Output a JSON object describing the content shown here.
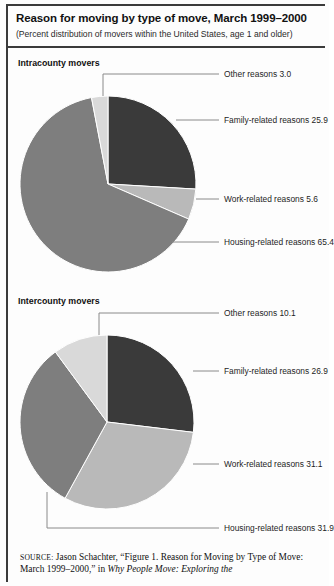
{
  "figure": {
    "title": "Reason for moving by type of move, March 1999–2000",
    "subtitle": "(Percent distribution of movers within the United States, age 1 and older)",
    "source_label": "SOURCE:",
    "source_text_1": " Jason Schachter, “Figure 1. Reason for Moving by Type of",
    "source_text_2": "Move: March 1999–2000,” in ",
    "source_text_italic": "Why People Move: Exploring the"
  },
  "colors": {
    "family": "#3a3a3a",
    "work": "#b9b9b9",
    "housing": "#7e7e7e",
    "other": "#d9d9d9",
    "leader": "#8a8a8a",
    "rule": "#3b3b3b"
  },
  "panels": [
    {
      "title": "Intracounty movers"
    },
    {
      "title": "Intercounty movers"
    }
  ],
  "chart_data": [
    {
      "type": "pie",
      "title": "Intracounty movers",
      "labels": [
        "Family-related reasons",
        "Work-related reasons",
        "Housing-related reasons",
        "Other reasons"
      ],
      "values": [
        25.9,
        5.6,
        65.4,
        3.0
      ],
      "units": "percent",
      "start_angle_deg": 0,
      "direction": "clockwise",
      "legend": "leader-line callouts",
      "annotations": [
        "Other reasons 3.0",
        "Family-related reasons 25.9",
        "Work-related reasons 5.6",
        "Housing-related reasons 65.4"
      ]
    },
    {
      "type": "pie",
      "title": "Intercounty movers",
      "labels": [
        "Family-related reasons",
        "Work-related reasons",
        "Housing-related reasons",
        "Other reasons"
      ],
      "values": [
        26.9,
        31.1,
        31.9,
        10.1
      ],
      "units": "percent",
      "start_angle_deg": 0,
      "direction": "clockwise",
      "legend": "leader-line callouts",
      "annotations": [
        "Other reasons 10.1",
        "Family-related reasons 26.9",
        "Work-related reasons 31.1",
        "Housing-related reasons 31.9"
      ]
    }
  ],
  "callouts": {
    "pie1": {
      "other": "Other reasons 3.0",
      "family": "Family-related reasons 25.9",
      "work": "Work-related reasons 5.6",
      "housing": "Housing-related reasons 65.4"
    },
    "pie2": {
      "other": "Other reasons 10.1",
      "family": "Family-related reasons 26.9",
      "work": "Work-related reasons 31.1",
      "housing": "Housing-related reasons 31.9"
    }
  }
}
